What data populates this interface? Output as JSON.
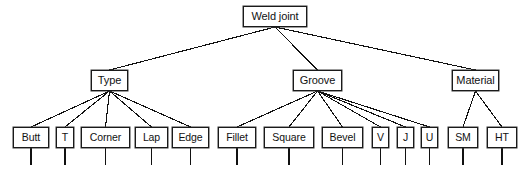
{
  "diagram": {
    "type": "tree",
    "title": "Weld joint",
    "orientation": "top-down",
    "background_color": "#ffffff",
    "line_color": "#111111",
    "box_fill": "#ffffff",
    "box_border": "#1a1a1a",
    "levels": 3,
    "root": {
      "id": "weld-joint",
      "label": "Weld joint",
      "x": 243,
      "y": 6,
      "w": 64,
      "h": 21
    },
    "branches": [
      {
        "id": "type",
        "label": "Type",
        "x": 91,
        "y": 70,
        "w": 37,
        "h": 21,
        "children": [
          {
            "id": "butt",
            "label": "Butt",
            "x": 13,
            "y": 127,
            "w": 36,
            "h": 21,
            "stub": 17
          },
          {
            "id": "t",
            "label": "T",
            "x": 56,
            "y": 127,
            "w": 18,
            "h": 21,
            "stub": 17
          },
          {
            "id": "corner",
            "label": "Corner",
            "x": 81,
            "y": 127,
            "w": 49,
            "h": 21,
            "stub": 17
          },
          {
            "id": "lap",
            "label": "Lap",
            "x": 135,
            "y": 127,
            "w": 33,
            "h": 21,
            "stub": 17
          },
          {
            "id": "edge",
            "label": "Edge",
            "x": 172,
            "y": 127,
            "w": 37,
            "h": 21,
            "stub": 17
          }
        ]
      },
      {
        "id": "groove",
        "label": "Groove",
        "x": 293,
        "y": 70,
        "w": 49,
        "h": 21,
        "children": [
          {
            "id": "fillet",
            "label": "Fillet",
            "x": 218,
            "y": 127,
            "w": 38,
            "h": 21,
            "stub": 17
          },
          {
            "id": "square",
            "label": "Square",
            "x": 264,
            "y": 127,
            "w": 50,
            "h": 21,
            "stub": 17
          },
          {
            "id": "bevel",
            "label": "Bevel",
            "x": 322,
            "y": 127,
            "w": 41,
            "h": 21,
            "stub": 17
          },
          {
            "id": "v",
            "label": "V",
            "x": 372,
            "y": 127,
            "w": 17,
            "h": 21,
            "stub": 17
          },
          {
            "id": "j",
            "label": "J",
            "x": 397,
            "y": 127,
            "w": 17,
            "h": 21,
            "stub": 17
          },
          {
            "id": "u",
            "label": "U",
            "x": 421,
            "y": 127,
            "w": 17,
            "h": 21,
            "stub": 17
          }
        ]
      },
      {
        "id": "material",
        "label": "Material",
        "x": 452,
        "y": 70,
        "w": 47,
        "h": 21,
        "children": [
          {
            "id": "sm",
            "label": "SM",
            "x": 448,
            "y": 127,
            "w": 30,
            "h": 21,
            "stub": 17
          },
          {
            "id": "ht",
            "label": "HT",
            "x": 487,
            "y": 127,
            "w": 30,
            "h": 21,
            "stub": 17
          }
        ]
      }
    ]
  }
}
